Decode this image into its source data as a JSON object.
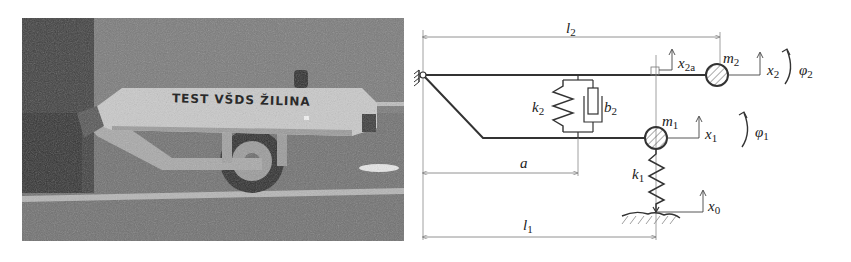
{
  "photo": {
    "description": "test trailer attached to vehicle on road",
    "trailer_text": "TEST VŠDS ŽILINA"
  },
  "diagram": {
    "labels": {
      "l2": {
        "base": "l",
        "sub": "2"
      },
      "l1": {
        "base": "l",
        "sub": "1"
      },
      "a": {
        "base": "a",
        "sub": ""
      },
      "k2": {
        "base": "k",
        "sub": "2"
      },
      "b2": {
        "base": "b",
        "sub": "2"
      },
      "k1": {
        "base": "k",
        "sub": "1"
      },
      "m1": {
        "base": "m",
        "sub": "1"
      },
      "m2": {
        "base": "m",
        "sub": "2"
      },
      "x2a": {
        "base": "x",
        "sub": "2a"
      },
      "x2": {
        "base": "x",
        "sub": "2"
      },
      "x1": {
        "base": "x",
        "sub": "1"
      },
      "x0": {
        "base": "x",
        "sub": "0"
      },
      "phi2": {
        "base": "φ",
        "sub": "2"
      },
      "phi1": {
        "base": "φ",
        "sub": "1"
      },
      "marker": "a"
    },
    "colors": {
      "line": "#333333",
      "dim_line": "#777777",
      "hatch": "#555555"
    }
  }
}
